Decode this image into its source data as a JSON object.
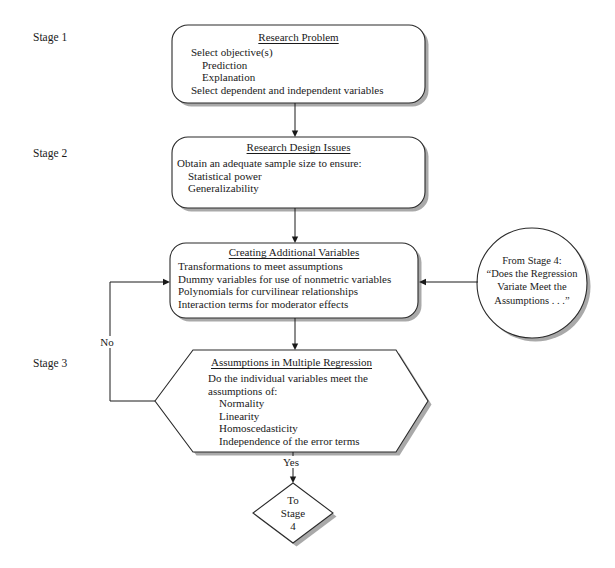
{
  "figure": {
    "stages": [
      "Stage 1",
      "Stage 2",
      "Stage 3"
    ],
    "boxes": {
      "research_problem": {
        "title": "Research Problem",
        "lines": [
          "Select objective(s)",
          "Prediction",
          "Explanation",
          "Select dependent and independent variables"
        ]
      },
      "research_design": {
        "title": "Research Design Issues",
        "lines": [
          "Obtain an adequate sample size to ensure:",
          "Statistical power",
          "Generalizability"
        ]
      },
      "creating_variables": {
        "title": "Creating Additional Variables",
        "lines": [
          "Transformations to meet assumptions",
          "Dummy variables for use of nonmetric variables",
          "Polynomials for curvilinear relationships",
          "Interaction terms for moderator effects"
        ]
      },
      "assumptions": {
        "title": "Assumptions in Multiple Regression",
        "lines": [
          "Do the individual variables meet the",
          "assumptions of:",
          "Normality",
          "Linearity",
          "Homoscedasticity",
          "Independence of the error terms"
        ]
      }
    },
    "circle": {
      "lines": [
        "From Stage 4:",
        "“Does the Regression",
        "Variate Meet the",
        "Assumptions . . .”"
      ]
    },
    "diamond": {
      "lines": [
        "To",
        "Stage",
        "4"
      ]
    },
    "decision_labels": {
      "no": "No",
      "yes": "Yes"
    },
    "colors": {
      "background": "#ffffff",
      "shape_fill": "#ffffff",
      "shape_stroke": "#2a2a2a",
      "shadow": "#a9a9a9",
      "text": "#1a1a1a"
    }
  }
}
